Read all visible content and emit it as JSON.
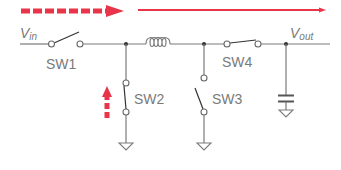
{
  "diagram": {
    "type": "circuit-schematic",
    "colors": {
      "wire": "#7a7a7a",
      "switch_lever": "#333333",
      "arrow": "#e8354a",
      "label": "#7a7a7a"
    },
    "labels": {
      "vin": "V",
      "vin_sub": "in",
      "vout": "V",
      "vout_sub": "out",
      "sw1": "SW1",
      "sw2": "SW2",
      "sw3": "SW3",
      "sw4": "SW4"
    },
    "components": [
      {
        "id": "SW1",
        "kind": "switch",
        "state": "open",
        "position": "series-input"
      },
      {
        "id": "L",
        "kind": "inductor",
        "position": "series"
      },
      {
        "id": "SW2",
        "kind": "switch",
        "state": "closed",
        "position": "shunt-to-ground"
      },
      {
        "id": "SW3",
        "kind": "switch",
        "state": "open",
        "position": "shunt-to-ground"
      },
      {
        "id": "SW4",
        "kind": "switch",
        "state": "closed",
        "position": "series-output"
      },
      {
        "id": "C",
        "kind": "capacitor",
        "position": "shunt-output"
      }
    ],
    "arrows": [
      {
        "name": "dashed-horizontal-arrow",
        "style": "dashed",
        "direction": "right"
      },
      {
        "name": "solid-horizontal-arrow",
        "style": "solid",
        "direction": "right"
      },
      {
        "name": "dashed-vertical-arrow",
        "style": "dashed",
        "direction": "up"
      }
    ]
  }
}
